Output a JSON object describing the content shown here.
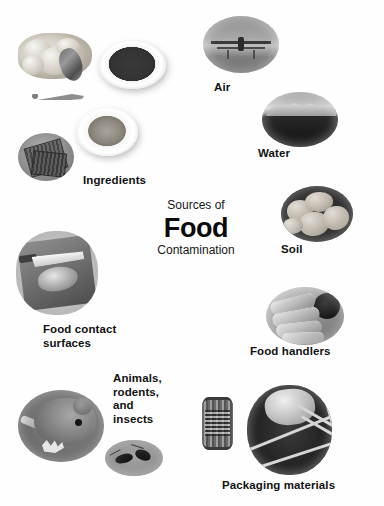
{
  "figure": {
    "title_lines": {
      "line1": "Sources of",
      "line2": "Food",
      "line3": "Contamination"
    },
    "background_color": "#ffffff",
    "text_color": "#121212"
  },
  "labels": {
    "ingredients": "Ingredients",
    "air": "Air",
    "water": "Water",
    "soil": "Soil",
    "food_contact_surfaces": "Food contact\nsurfaces",
    "food_handlers": "Food handlers",
    "animals_rodents_insects": "Animals,\nrodents,\nand\ninsects",
    "packaging_materials": "Packaging materials"
  },
  "images": {
    "ingredients_meat": "raw-poultry-photo",
    "ingredients_fish": "raw-fish-photo",
    "ingredients_knife": "knife-photo",
    "ingredients_plate_dark": "plate-of-dark-food-photo",
    "ingredients_plate_meat": "plate-of-ground-food-photo",
    "ingredients_can": "canned-goods-photo",
    "air": "crop-duster-airplane-photo",
    "water": "shoreline-water-photo",
    "soil": "potatoes-in-soil-photo",
    "food_contact_surfaces": "cutting-board-and-knife-photo",
    "food_handlers": "hands-photo",
    "rodent": "rodent-photo",
    "insects": "cockroaches-photo",
    "packaging_can": "metal-can-photo",
    "packaging_wrapped": "wrapped-package-photo"
  }
}
